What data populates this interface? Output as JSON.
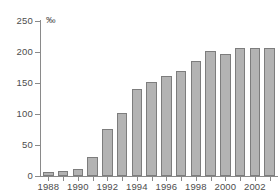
{
  "chart_data": {
    "type": "bar",
    "title": "",
    "subtitle": "",
    "xlabel": "",
    "ylabel": "",
    "unit_label": "‰",
    "ylim": [
      0,
      250
    ],
    "yticks": [
      0,
      50,
      100,
      150,
      200,
      250
    ],
    "ytick_labels": [
      "0",
      "50",
      "100",
      "150",
      "200",
      "250"
    ],
    "grid": false,
    "legend": false,
    "legend_position": "none",
    "categories": [
      "1988",
      "1989",
      "1990",
      "1991",
      "1992",
      "1993",
      "1994",
      "1995",
      "1996",
      "1997",
      "1998",
      "1999",
      "2000",
      "2001",
      "2002",
      "2003"
    ],
    "xtick_labels_shown": [
      "1988",
      "1990",
      "1992",
      "1994",
      "1996",
      "1998",
      "2000",
      "2002"
    ],
    "values": [
      7,
      8,
      11,
      31,
      76,
      102,
      141,
      152,
      161,
      170,
      185,
      201,
      196,
      206,
      206,
      207
    ],
    "series": [
      {
        "name": "",
        "values": [
          7,
          8,
          11,
          31,
          76,
          102,
          141,
          152,
          161,
          170,
          185,
          201,
          196,
          206,
          206,
          207
        ]
      }
    ],
    "colors": {
      "bar_fill": "#b3b3b3",
      "bar_border": "#7d7d7d",
      "axis": "#8a8a8a",
      "text": "#4d4d4d",
      "background": "#ffffff"
    }
  }
}
